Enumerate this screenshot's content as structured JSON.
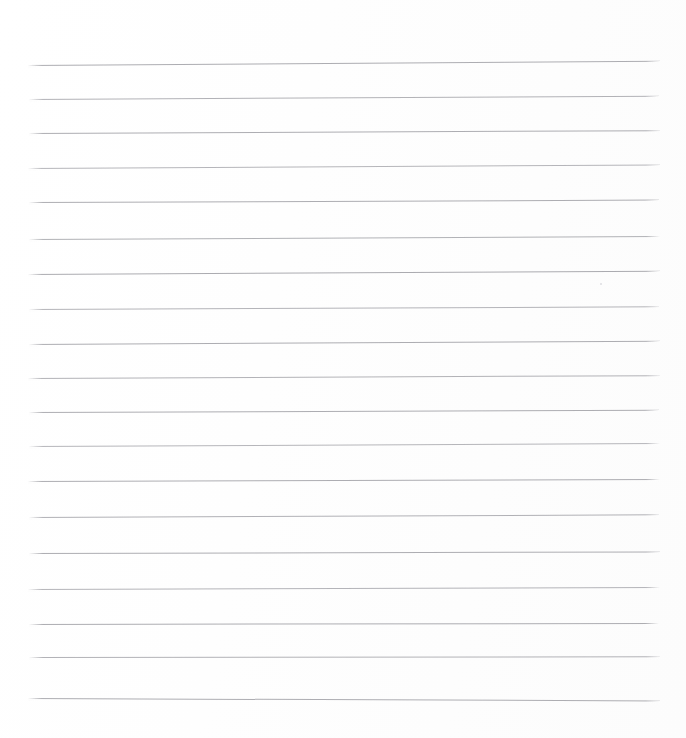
{
  "document": {
    "kind": "lined-paper-scan",
    "title": "Blank ruled notebook page",
    "description": "A scanned sheet of blank lined writing paper with no handwriting or printed text.",
    "width_px": 686,
    "height_px": 738,
    "background_color": "#fdfdfd",
    "page_color": "#ffffff",
    "text_content": "",
    "line_count_label": "20"
  },
  "ruling": {
    "line_color": "#a9a9ae",
    "line_color_light": "#c4c4c8",
    "line_thickness_px": 1,
    "left_margin_px": 28,
    "right_edge_px": 660,
    "line_length_px": 632,
    "first_line_y_px": 65,
    "average_spacing_px": 34,
    "rotation_deg": -0.35,
    "has_vertical_margin_rule": false,
    "has_holes": false
  },
  "lines": [
    {
      "index": 1,
      "y": 65,
      "x": 28,
      "width": 632,
      "tilt": -0.38,
      "color": "#a9a9ae",
      "opacity": 0.95
    },
    {
      "index": 2,
      "y": 99,
      "x": 29,
      "width": 630,
      "tilt": -0.3,
      "color": "#acacb1",
      "opacity": 0.92
    },
    {
      "index": 3,
      "y": 133,
      "x": 29,
      "width": 631,
      "tilt": -0.26,
      "color": "#a9a9ae",
      "opacity": 0.95
    },
    {
      "index": 4,
      "y": 168,
      "x": 28,
      "width": 632,
      "tilt": -0.32,
      "color": "#aeaeb3",
      "opacity": 0.9
    },
    {
      "index": 5,
      "y": 202,
      "x": 29,
      "width": 630,
      "tilt": -0.22,
      "color": "#a9a9ae",
      "opacity": 0.95
    },
    {
      "index": 6,
      "y": 239,
      "x": 29,
      "width": 631,
      "tilt": -0.28,
      "color": "#abacb0",
      "opacity": 0.93
    },
    {
      "index": 7,
      "y": 274,
      "x": 28,
      "width": 632,
      "tilt": -0.3,
      "color": "#a8a8ad",
      "opacity": 0.96
    },
    {
      "index": 8,
      "y": 309,
      "x": 29,
      "width": 630,
      "tilt": -0.24,
      "color": "#adadb2",
      "opacity": 0.91
    },
    {
      "index": 9,
      "y": 344,
      "x": 29,
      "width": 631,
      "tilt": -0.3,
      "color": "#a9a9ae",
      "opacity": 0.95
    },
    {
      "index": 10,
      "y": 378,
      "x": 28,
      "width": 632,
      "tilt": -0.26,
      "color": "#acacb1",
      "opacity": 0.92
    },
    {
      "index": 11,
      "y": 412,
      "x": 29,
      "width": 630,
      "tilt": -0.2,
      "color": "#a9a9ae",
      "opacity": 0.95
    },
    {
      "index": 12,
      "y": 446,
      "x": 29,
      "width": 631,
      "tilt": -0.28,
      "color": "#aeaeb3",
      "opacity": 0.9
    },
    {
      "index": 13,
      "y": 481,
      "x": 28,
      "width": 632,
      "tilt": -0.18,
      "color": "#a9a9ae",
      "opacity": 0.95
    },
    {
      "index": 14,
      "y": 517,
      "x": 29,
      "width": 630,
      "tilt": -0.24,
      "color": "#ababb0",
      "opacity": 0.93
    },
    {
      "index": 15,
      "y": 553,
      "x": 29,
      "width": 631,
      "tilt": -0.14,
      "color": "#a9a9ae",
      "opacity": 0.95
    },
    {
      "index": 16,
      "y": 589,
      "x": 28,
      "width": 632,
      "tilt": -0.18,
      "color": "#adadb2",
      "opacity": 0.91
    },
    {
      "index": 17,
      "y": 624,
      "x": 29,
      "width": 630,
      "tilt": -0.1,
      "color": "#a9a9ae",
      "opacity": 0.95
    },
    {
      "index": 18,
      "y": 657,
      "x": 29,
      "width": 631,
      "tilt": -0.06,
      "color": "#acacb1",
      "opacity": 0.92
    },
    {
      "index": 19,
      "y": 698,
      "x": 28,
      "width": 632,
      "tilt": 0.22,
      "color": "#a9a9ae",
      "opacity": 0.95
    }
  ],
  "artifacts": [
    {
      "name": "dust-speck",
      "x": 600,
      "y": 283,
      "size": 2,
      "color": "#dedee2"
    }
  ]
}
